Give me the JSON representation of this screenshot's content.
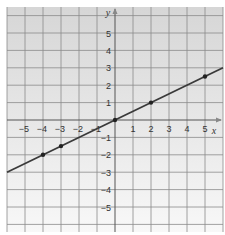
{
  "chart_data": {
    "type": "line",
    "title": "",
    "xlabel": "x",
    "ylabel": "y",
    "xlim": [
      -6,
      6
    ],
    "ylim": [
      -6.5,
      6.5
    ],
    "grid": true,
    "x_ticks": [
      -5,
      -4,
      -3,
      -2,
      -1,
      1,
      2,
      3,
      4,
      5
    ],
    "y_ticks": [
      5,
      4,
      3,
      2,
      1,
      -1,
      -2,
      -3,
      -4,
      -5
    ],
    "x_tick_labels": [
      "−5",
      "−4",
      "−3",
      "−2",
      "−1",
      "1",
      "2",
      "3",
      "4",
      "5"
    ],
    "y_tick_labels": [
      "5",
      "4",
      "3",
      "2",
      "1",
      "−1",
      "−2",
      "−3",
      "−4",
      "−5"
    ],
    "series": [
      {
        "name": "y = 0.5x",
        "line": {
          "x": [
            -6,
            6
          ],
          "y": [
            -3,
            3
          ]
        },
        "points": [
          {
            "x": -4,
            "y": -2
          },
          {
            "x": -3,
            "y": -1.5
          },
          {
            "x": 0,
            "y": 0
          },
          {
            "x": 2,
            "y": 1
          },
          {
            "x": 5,
            "y": 2.5
          }
        ]
      }
    ],
    "colors": {
      "line": "#3a3a3a",
      "grid": "#8a8a8a",
      "background_top": "#d9d9d9",
      "background_bottom": "#f7f7f7"
    }
  }
}
